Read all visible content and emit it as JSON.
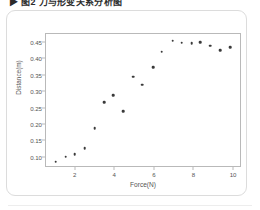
{
  "caption": {
    "text": "▶ 图2  力与形变关系分析图"
  },
  "figure": {
    "card_border_color": "#dcdcdc",
    "background_color": "#ffffff"
  },
  "chart_data": {
    "type": "scatter",
    "title": "",
    "xlabel": "Force(N)",
    "ylabel": "Distance(m)",
    "xlim": [
      0.5,
      10.4
    ],
    "ylim": [
      0.068,
      0.478
    ],
    "xticks": [
      2,
      4,
      6,
      8,
      10
    ],
    "yticks": [
      0.1,
      0.15,
      0.2,
      0.25,
      0.3,
      0.35,
      0.4,
      0.45
    ],
    "ytick_labels": [
      "0.10",
      "0.15",
      "0.20",
      "0.25",
      "0.30",
      "0.35",
      "0.40",
      "0.45"
    ],
    "xtick_labels": [
      "2",
      "4",
      "6",
      "8",
      "10"
    ],
    "grid": false,
    "legend": null,
    "marker_color": "#3a3a3a",
    "axis_color": "#b9b9b9",
    "series": [
      {
        "name": "Distance vs Force",
        "x": [
          1.0,
          1.5,
          1.95,
          2.45,
          2.95,
          3.45,
          3.9,
          4.4,
          4.9,
          5.35,
          5.9,
          6.35,
          6.9,
          7.35,
          7.85,
          8.3,
          8.8,
          9.3,
          9.8
        ],
        "y": [
          0.087,
          0.102,
          0.11,
          0.129,
          0.189,
          0.27,
          0.29,
          0.242,
          0.347,
          0.323,
          0.376,
          0.424,
          0.458,
          0.451,
          0.449,
          0.453,
          0.442,
          0.429,
          0.437
        ]
      }
    ]
  }
}
